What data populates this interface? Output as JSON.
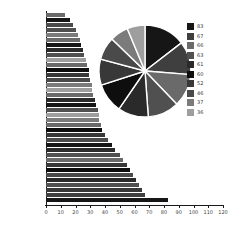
{
  "page": {
    "background": "#ffffff"
  },
  "chart_data": [
    {
      "type": "bar",
      "orientation": "horizontal",
      "title": "",
      "xlabel": "",
      "ylabel": "",
      "xlim": [
        0,
        120
      ],
      "x_ticks": [
        0,
        10,
        20,
        30,
        40,
        50,
        60,
        70,
        80,
        90,
        100,
        110,
        120
      ],
      "grid": false,
      "values": [
        13,
        16,
        18,
        20,
        22,
        23,
        24,
        25,
        26,
        27,
        28,
        29,
        29,
        30,
        31,
        31,
        32,
        33,
        34,
        35,
        36,
        36,
        37,
        38,
        40,
        42,
        45,
        47,
        50,
        52,
        55,
        57,
        59,
        61,
        63,
        65,
        67,
        83
      ],
      "bar_colors": [
        "#6a6a6a",
        "#161616",
        "#4a4a4a",
        "#505050",
        "#7b7b7b",
        "#6a6a6a",
        "#161616",
        "#2a2a2a",
        "#505050",
        "#9e9e9e",
        "#6a6a6a",
        "#0e0e0e",
        "#383838",
        "#4a4a4a",
        "#7b7b7b",
        "#9e9e9e",
        "#6a6a6a",
        "#2a2a2a",
        "#161616",
        "#505050",
        "#9e9e9e",
        "#7b7b7b",
        "#6a6a6a",
        "#0e0e0e",
        "#383838",
        "#4a4a4a",
        "#161616",
        "#2a2a2a",
        "#505050",
        "#6a6a6a",
        "#383838",
        "#0e0e0e",
        "#4a4a4a",
        "#2a2a2a",
        "#505050",
        "#383838",
        "#3f3f3f",
        "#161616"
      ],
      "axis_color": "#1a1a1a",
      "tick_label_color": "#444444"
    },
    {
      "type": "pie",
      "title": "",
      "values": [
        83,
        67,
        66,
        63,
        61,
        60,
        52,
        46,
        37,
        36
      ],
      "labels": [
        "83",
        "67",
        "66",
        "63",
        "61",
        "60",
        "52",
        "46",
        "37",
        "36"
      ],
      "colors": [
        "#161616",
        "#3f3f3f",
        "#6a6a6a",
        "#505050",
        "#2a2a2a",
        "#0e0e0e",
        "#383838",
        "#4a4a4a",
        "#7b7b7b",
        "#9e9e9e"
      ],
      "start_angle_deg": 0,
      "direction": "clockwise",
      "slice_border_color": "#ffffff",
      "legend_position": "right"
    }
  ]
}
